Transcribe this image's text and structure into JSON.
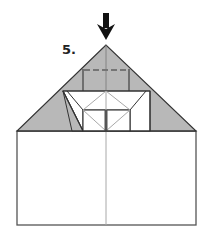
{
  "diagram": {
    "step_number": "5.",
    "colors": {
      "paper_colored": "#b8b8b8",
      "paper_white": "#ffffff",
      "outline": "#333333",
      "crease_light": "#a8a8a8",
      "arrow": "#111111"
    },
    "elements": [
      {
        "name": "push-arrow",
        "description": "Downward arrow pointing at apex"
      },
      {
        "name": "triangle-colored",
        "description": "Gray colored triangular top layer"
      },
      {
        "name": "valley-fold-line",
        "description": "Dashed fold line near top"
      },
      {
        "name": "white-band",
        "description": "White trapezoidal band with inner folded rectangle"
      },
      {
        "name": "base-rectangle",
        "description": "White rectangular base with center crease"
      }
    ]
  }
}
